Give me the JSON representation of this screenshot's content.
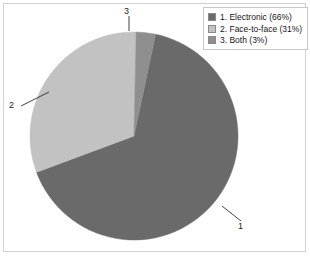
{
  "chart_data": {
    "type": "pie",
    "title": "",
    "categories": [
      "Electronic",
      "Face-to-face",
      "Both"
    ],
    "values": [
      66,
      31,
      3
    ],
    "value_unit": "%",
    "legend_position": "top-right",
    "grid": false,
    "slices": [
      {
        "index": "1",
        "name": "Electronic",
        "percent": 66,
        "color": "#6a6a6a",
        "legend_label": "1. Electronic (66%)",
        "callout": "1"
      },
      {
        "index": "2",
        "name": "Face-to-face",
        "percent": 31,
        "color": "#c2c2c2",
        "legend_label": "2. Face-to-face (31%)",
        "callout": "2"
      },
      {
        "index": "3",
        "name": "Both",
        "percent": 3,
        "color": "#8f8f8f",
        "legend_label": "3. Both (3%)",
        "callout": "3"
      }
    ]
  },
  "legend": {
    "items": [
      {
        "label": "1. Electronic (66%)",
        "color": "#6a6a6a"
      },
      {
        "label": "2. Face-to-face (31%)",
        "color": "#c2c2c2"
      },
      {
        "label": "3. Both (3%)",
        "color": "#8f8f8f"
      }
    ]
  },
  "callouts": {
    "one": "1",
    "two": "2",
    "three": "3"
  },
  "colors": {
    "slice1": "#6a6a6a",
    "slice2": "#c2c2c2",
    "slice3": "#8f8f8f",
    "frame": "#d2d2d2",
    "legend_border": "#c8c8c8",
    "leader_line": "#2b2b2b",
    "background": "#ffffff"
  }
}
